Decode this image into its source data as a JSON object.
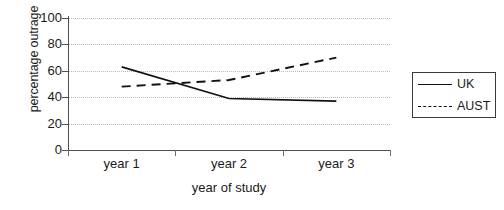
{
  "chart_data": {
    "type": "line",
    "title": "",
    "xlabel": "year of study",
    "ylabel": "percentage outrage",
    "categories": [
      "year 1",
      "year 2",
      "year 3"
    ],
    "ylim": [
      0,
      100
    ],
    "yticks": [
      0,
      20,
      40,
      60,
      80,
      100
    ],
    "grid": true,
    "legend_position": "right",
    "series": [
      {
        "name": "UK",
        "style": "solid",
        "color": "#111111",
        "values": [
          63,
          39,
          37
        ]
      },
      {
        "name": "AUST",
        "style": "dashed",
        "color": "#111111",
        "values": [
          48,
          53,
          70
        ]
      }
    ],
    "annotations": {
      "crossing_note": "UK and AUST lines cross at approximately 52 percent between year 1 and year 2"
    }
  },
  "axes": {
    "y_tick_labels": [
      "100",
      "80",
      "60",
      "40",
      "20",
      "0"
    ],
    "x_tick_labels": [
      "year 1",
      "year 2",
      "year 3"
    ]
  },
  "legend": {
    "entries": [
      {
        "label": "UK",
        "style": "solid"
      },
      {
        "label": "AUST",
        "style": "dashed"
      }
    ]
  }
}
